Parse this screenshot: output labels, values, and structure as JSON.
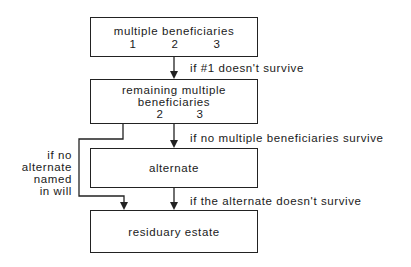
{
  "diagram": {
    "boxes": {
      "multiple": {
        "title": "multiple beneficiaries",
        "numbers": [
          "1",
          "2",
          "3"
        ]
      },
      "remaining": {
        "title_line1": "remaining multiple",
        "title_line2": "beneficiaries",
        "numbers": [
          "2",
          "3"
        ]
      },
      "alternate": {
        "title": "alternate"
      },
      "residuary": {
        "title": "residuary estate"
      }
    },
    "edges": {
      "multiple_to_remaining": "if #1 doesn't survive",
      "remaining_to_alternate": "if no multiple beneficiaries survive",
      "alternate_to_residuary": "if the alternate doesn't survive",
      "remaining_to_residuary": {
        "line1": "if no",
        "line2": "alternate",
        "line3": "named",
        "line4": "in will"
      }
    },
    "colors": {
      "stroke": "#222222",
      "background": "#ffffff"
    }
  }
}
